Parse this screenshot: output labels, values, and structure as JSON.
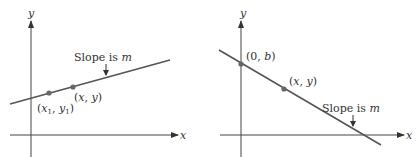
{
  "colors": {
    "axis": "#444444",
    "line": "#555555",
    "point": "#666666",
    "text": "#333333"
  },
  "left_panel": {
    "y_axis_label": "y",
    "x_axis_label": "x",
    "slope_label_prefix": "Slope is ",
    "slope_label_var": "m",
    "point1": {
      "open": "(",
      "x": "x",
      "sub1": "1",
      "comma": ", ",
      "y": "y",
      "sub2": "1",
      "close": ")"
    },
    "point2": {
      "open": "(",
      "x": "x",
      "comma": ", ",
      "y": "y",
      "close": ")"
    }
  },
  "right_panel": {
    "y_axis_label": "y",
    "x_axis_label": "x",
    "intercept_point": {
      "open": "(0, ",
      "b": "b",
      "close": ")"
    },
    "point": {
      "open": "(",
      "x": "x",
      "comma": ", ",
      "y": "y",
      "close": ")"
    },
    "slope_label_prefix": "Slope is ",
    "slope_label_var": "m"
  }
}
